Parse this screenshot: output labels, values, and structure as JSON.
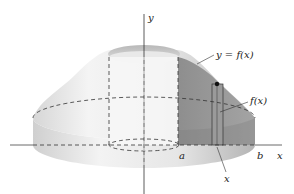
{
  "figure": {
    "labels": {
      "y_axis": "y",
      "x_axis": "x",
      "curve": "y = f(x)",
      "shell_height": "f(x)",
      "a": "a",
      "b": "b",
      "shell_radius": "x"
    },
    "colors": {
      "solid_light": "#f2f2f2",
      "solid_mid": "#d4d4d4",
      "solid_dark": "#a8a8a8",
      "cross_section": "#8c8c8c",
      "cross_section_dark": "#7a7a7a",
      "axis": "#333333",
      "dash": "#333333"
    }
  }
}
